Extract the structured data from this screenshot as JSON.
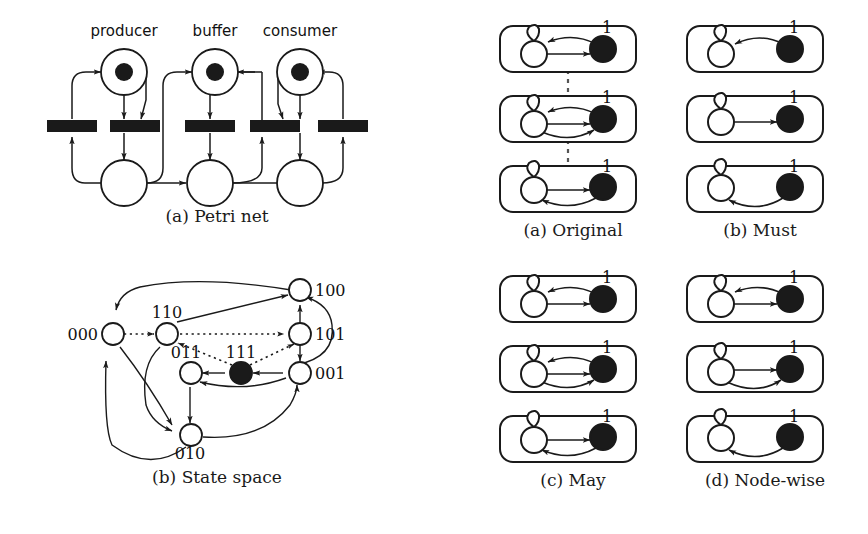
{
  "figure": {
    "title_implicit": "Petri net, state space and abstraction variants",
    "background_color": "#ffffff",
    "ink_color": "#1a1a1a"
  },
  "panels": {
    "petri_net": {
      "caption": "(a)  Petri net",
      "place_labels": [
        "producer",
        "buffer",
        "consumer"
      ],
      "top_places": [
        {
          "name": "producer",
          "tokens": 1
        },
        {
          "name": "buffer",
          "tokens": 1
        },
        {
          "name": "consumer",
          "tokens": 1
        }
      ],
      "bottom_places": [
        {
          "name": "producer-idle",
          "tokens": 0
        },
        {
          "name": "buffer-empty",
          "tokens": 0
        },
        {
          "name": "consumer-idle",
          "tokens": 0
        }
      ],
      "transitions_count": 5
    },
    "state_space": {
      "caption": "(b)  State space",
      "nodes": [
        {
          "id": "000",
          "label": "000",
          "filled": false,
          "label_side": "left"
        },
        {
          "id": "100",
          "label": "100",
          "filled": false,
          "label_side": "right"
        },
        {
          "id": "110",
          "label": "110",
          "filled": false,
          "label_side": "above"
        },
        {
          "id": "101",
          "label": "101",
          "filled": false,
          "label_side": "right"
        },
        {
          "id": "011",
          "label": "011",
          "filled": false,
          "label_side": "above"
        },
        {
          "id": "111",
          "label": "111",
          "filled": true,
          "label_side": "above"
        },
        {
          "id": "001",
          "label": "001",
          "filled": false,
          "label_side": "right"
        },
        {
          "id": "010",
          "label": "010",
          "filled": false,
          "label_side": "below"
        }
      ],
      "solid_edges": [
        {
          "from": "100",
          "to": "000"
        },
        {
          "from": "101",
          "to": "100"
        },
        {
          "from": "110",
          "to": "100"
        },
        {
          "from": "001",
          "to": "100"
        },
        {
          "from": "111",
          "to": "011"
        },
        {
          "from": "001",
          "to": "111"
        },
        {
          "from": "001",
          "to": "011"
        },
        {
          "from": "011",
          "to": "010"
        },
        {
          "from": "110",
          "to": "010"
        },
        {
          "from": "000",
          "to": "010"
        },
        {
          "from": "010",
          "to": "001"
        },
        {
          "from": "010",
          "to": "000"
        },
        {
          "from": "101",
          "to": "001"
        }
      ],
      "dotted_edges": [
        {
          "from": "000",
          "to": "110"
        },
        {
          "from": "110",
          "to": "101"
        },
        {
          "from": "111",
          "to": "110"
        },
        {
          "from": "111",
          "to": "101"
        }
      ]
    },
    "original": {
      "caption": "(a)  Original",
      "node_labels": [
        "0",
        "1"
      ],
      "boxes": [
        {
          "index": 1,
          "edges": [
            "arc-1-to-0-top",
            "straight-0-to-1"
          ]
        },
        {
          "index": 2,
          "edges": [
            "arc-1-to-0-top",
            "straight-0-to-1",
            "arc-0-to-1-bottom"
          ]
        },
        {
          "index": 3,
          "edges": [
            "straight-0-to-1",
            "arc-1-to-0-bottom"
          ]
        }
      ],
      "has_dashed_connectors": true
    },
    "must": {
      "caption": "(b)  Must",
      "node_labels": [
        "0",
        "1"
      ],
      "boxes": [
        {
          "index": 1,
          "edges": [
            "arc-1-to-0-top"
          ]
        },
        {
          "index": 2,
          "edges": [
            "straight-0-to-1"
          ]
        },
        {
          "index": 3,
          "edges": [
            "arc-1-to-0-bottom"
          ]
        }
      ],
      "has_dashed_connectors": false
    },
    "may": {
      "caption": "(c)  May",
      "node_labels": [
        "0",
        "1"
      ],
      "boxes": [
        {
          "index": 1,
          "edges": [
            "arc-1-to-0-top",
            "straight-0-to-1"
          ]
        },
        {
          "index": 2,
          "edges": [
            "arc-1-to-0-top",
            "straight-0-to-1",
            "arc-0-to-1-bottom"
          ]
        },
        {
          "index": 3,
          "edges": [
            "straight-0-to-1",
            "arc-1-to-0-bottom"
          ]
        }
      ],
      "has_dashed_connectors": false
    },
    "node_wise": {
      "caption": "(d)  Node-wise",
      "node_labels": [
        "0",
        "1"
      ],
      "boxes": [
        {
          "index": 1,
          "edges": [
            "arc-1-to-0-top",
            "straight-0-to-1"
          ]
        },
        {
          "index": 2,
          "edges": [
            "straight-0-to-1",
            "arc-0-to-1-bottom"
          ]
        },
        {
          "index": 3,
          "edges": [
            "arc-1-to-0-bottom"
          ]
        }
      ],
      "has_dashed_connectors": false
    }
  }
}
